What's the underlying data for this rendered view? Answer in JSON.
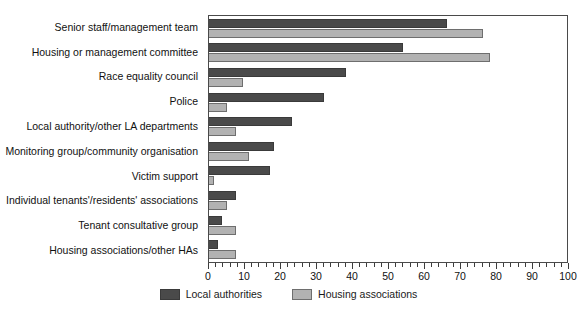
{
  "chart_data": {
    "type": "bar",
    "orientation": "horizontal",
    "title": "",
    "xlabel": "",
    "ylabel": "",
    "xlim": [
      0,
      100
    ],
    "xticks": [
      0,
      10,
      20,
      30,
      40,
      50,
      60,
      70,
      80,
      90,
      100
    ],
    "minor_tick_step": 2,
    "grid": false,
    "legend_position": "bottom",
    "categories": [
      "Senior staff/management team",
      "Housing or management committee",
      "Race equality council",
      "Police",
      "Local authority/other LA departments",
      "Monitoring group/community organisation",
      "Victim support",
      "Individual tenants'/residents' associations",
      "Tenant consultative group",
      "Housing associations/other HAs"
    ],
    "series": [
      {
        "name": "Local authorities",
        "color": "#4a4a4a",
        "values": [
          66,
          54,
          38,
          32,
          23,
          18,
          17,
          7.5,
          3.5,
          2.5
        ]
      },
      {
        "name": "Housing associations",
        "color": "#b2b2b2",
        "values": [
          76,
          78,
          9.5,
          5,
          7.5,
          11,
          1.5,
          5,
          7.5,
          7.5
        ]
      }
    ]
  },
  "legend": {
    "items": [
      {
        "label": "Local authorities"
      },
      {
        "label": "Housing associations"
      }
    ]
  }
}
